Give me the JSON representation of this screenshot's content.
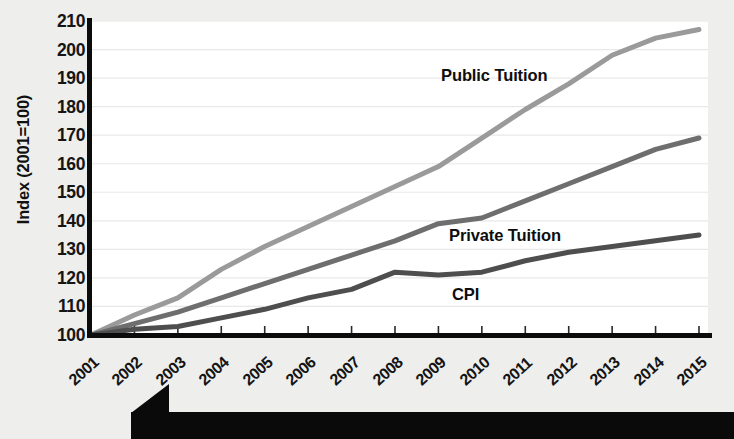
{
  "axes": {
    "y_title": "Index (2001=100)",
    "y_ticks": [
      100,
      110,
      120,
      130,
      140,
      150,
      160,
      170,
      180,
      190,
      200,
      210
    ],
    "x_ticks": [
      "2001",
      "2002",
      "2003",
      "2004",
      "2005",
      "2006",
      "2007",
      "2008",
      "2009",
      "2010",
      "2011",
      "2012",
      "2013",
      "2014",
      "2015"
    ]
  },
  "labels": {
    "public": "Public Tuition",
    "private": "Private Tuition",
    "cpi": "CPI"
  },
  "colors": {
    "public": "#9a9a9a",
    "private": "#6e6e6e",
    "cpi": "#4e4e4e",
    "axis": "#0c0c0c",
    "grid": "#e8e8e6",
    "plot_bg": "#ffffff",
    "page_bg": "#eeeeec",
    "banner": "#0a0a0a"
  },
  "chart_data": {
    "type": "line",
    "title": "",
    "xlabel": "",
    "ylabel": "Index (2001=100)",
    "x": [
      "2001",
      "2002",
      "2003",
      "2004",
      "2005",
      "2006",
      "2007",
      "2008",
      "2009",
      "2010",
      "2011",
      "2012",
      "2013",
      "2014",
      "2015"
    ],
    "xlim": [
      2001,
      2015
    ],
    "ylim": [
      100,
      210
    ],
    "ytick_step": 10,
    "grid": true,
    "legend": "inline-labels",
    "series": [
      {
        "name": "Public Tuition",
        "color": "#9a9a9a",
        "values": [
          100,
          107,
          113,
          123,
          131,
          138,
          145,
          152,
          159,
          169,
          179,
          188,
          198,
          204,
          207
        ]
      },
      {
        "name": "Private Tuition",
        "color": "#6e6e6e",
        "values": [
          100,
          104,
          108,
          113,
          118,
          123,
          128,
          133,
          139,
          141,
          147,
          153,
          159,
          165,
          169
        ]
      },
      {
        "name": "CPI",
        "color": "#4e4e4e",
        "values": [
          100,
          102,
          103,
          106,
          109,
          113,
          116,
          122,
          121,
          122,
          126,
          129,
          131,
          133,
          135
        ]
      }
    ]
  }
}
